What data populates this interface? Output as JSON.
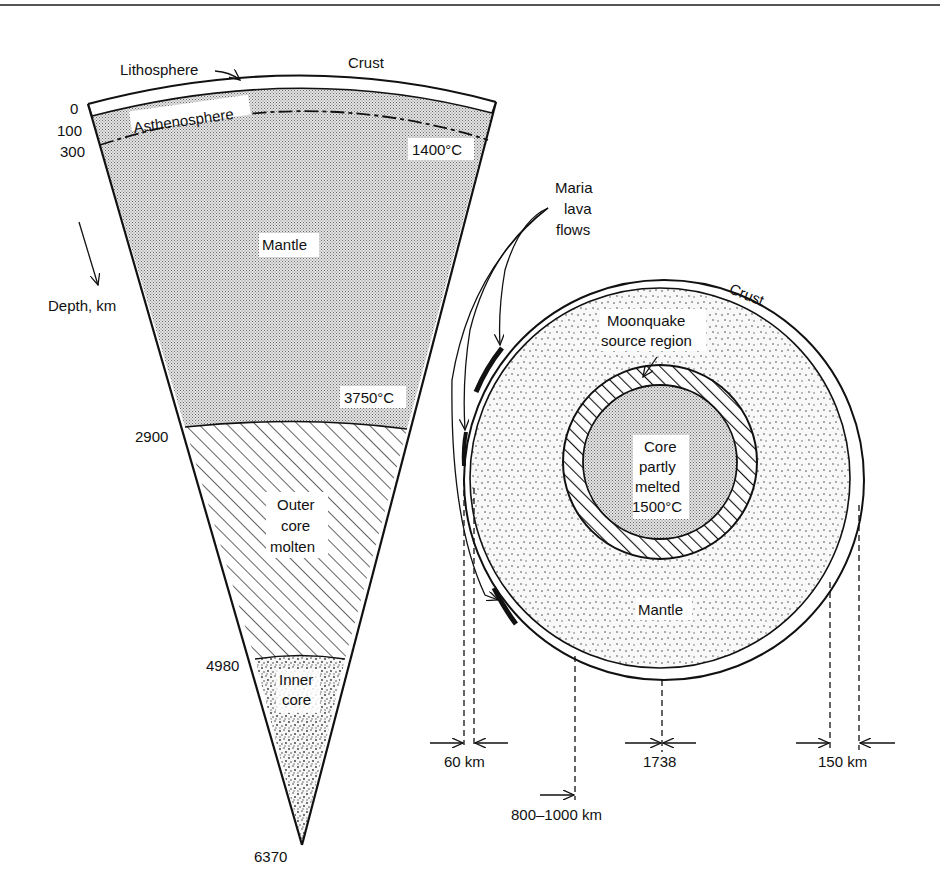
{
  "earth": {
    "labels": {
      "lithosphere": "Lithosphere",
      "crust": "Crust",
      "asthenosphere": "Asthenosphere",
      "mantle": "Mantle",
      "temp_1400": "1400°C",
      "temp_3750": "3750°C",
      "outer_core_1": "Outer",
      "outer_core_2": "core",
      "outer_core_3": "molten",
      "inner_core_1": "Inner",
      "inner_core_2": "core",
      "depth_axis": "Depth,  km"
    },
    "depths": {
      "d0": "0",
      "d100": "100",
      "d300": "300",
      "d2900": "2900",
      "d4980": "4980",
      "d6370": "6370"
    }
  },
  "moon": {
    "labels": {
      "maria_1": "Maria",
      "maria_2": "lava",
      "maria_3": "flows",
      "crust": "Crust",
      "moonquake_1": "Moonquake",
      "moonquake_2": "source  region",
      "core_1": "Core",
      "core_2": "partly",
      "core_3": "melted",
      "core_4": "1500°C",
      "mantle": "Mantle"
    },
    "dimensions": {
      "near_side_crust": "60 km",
      "radius": "1738",
      "far_side_crust": "150 km",
      "moonquake_depth": "800–1000 km"
    }
  },
  "colors": {
    "ink": "#111111",
    "stipple_bg": "#d6d6d6",
    "paper": "#ffffff"
  }
}
